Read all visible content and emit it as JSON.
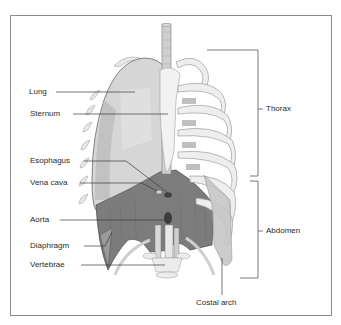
{
  "diagram": {
    "labels": {
      "lung": "Lung",
      "sternum": "Sternum",
      "esophagus": "Esophagus",
      "vena_cava": "Vena cava",
      "aorta": "Aorta",
      "diaphragm": "Diaphragm",
      "vertebrae": "Vertebrae",
      "thorax": "Thorax",
      "abdomen": "Abdomen",
      "costal_arch": "Costal arch"
    }
  },
  "colors": {
    "lung": "#d6d6d6",
    "lung_shade": "#b8b8b8",
    "diaphragm": "#7a7a7a",
    "bone": "#ececec",
    "bone_edge": "#a0a0a0",
    "leader_line": "#3a3a3a",
    "frame": "#8c8c8c"
  }
}
